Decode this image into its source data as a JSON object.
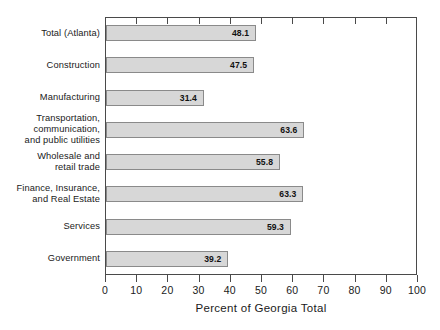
{
  "chart_data": {
    "type": "bar",
    "orientation": "horizontal",
    "title": "",
    "xlabel": "Percent of Georgia Total",
    "ylabel": "",
    "xlim": [
      0,
      100
    ],
    "xticks": [
      "0",
      "10",
      "20",
      "30",
      "40",
      "50",
      "60",
      "70",
      "80",
      "90",
      "100"
    ],
    "grid": false,
    "legend": null,
    "categories": [
      "Total (Atlanta)",
      "Construction",
      "Manufacturing",
      "Transportation,\ncommunication,\nand public utilities",
      "Wholesale and\nretail trade",
      "Finance, Insurance,\nand Real Estate",
      "Services",
      "Government"
    ],
    "values": [
      48.1,
      47.5,
      31.4,
      63.6,
      55.8,
      63.3,
      59.3,
      39.2
    ],
    "value_labels": [
      "48.1",
      "47.5",
      "31.4",
      "63.6",
      "55.8",
      "63.3",
      "59.3",
      "39.2"
    ],
    "bar_color": "#d7d7d7",
    "bar_border_color": "#8a8a8a",
    "axis_color": "#4a4a4a",
    "background_color": "#ffffff"
  }
}
